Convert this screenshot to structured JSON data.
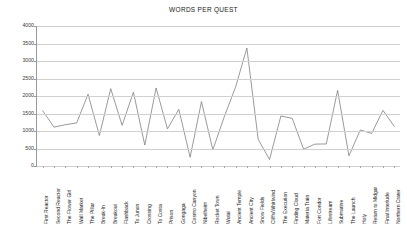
{
  "chart": {
    "title": "WORDS PER QUEST"
  },
  "chart_data": {
    "type": "line",
    "title": "WORDS PER QUEST",
    "xlabel": "",
    "ylabel": "",
    "ylim": [
      0,
      4000
    ],
    "ytick_step": 500,
    "yticks": [
      0,
      500,
      1000,
      1500,
      2000,
      2500,
      3000,
      3500,
      4000
    ],
    "grid": true,
    "legend": "none",
    "line_color": "#808080",
    "categories": [
      "First Reactor",
      "Second Reactor",
      "The Flower Girl",
      "Wall Market",
      "The Pillar",
      "Break-In",
      "Breakout",
      "Flashback",
      "To Junon",
      "Crossing",
      "To Costa",
      "Prison",
      "Gongaga",
      "Cosmo Canyon",
      "Nibelheim",
      "Rocket Town",
      "Wutai",
      "Ancient Temple",
      "Ancient City",
      "Snow Fields",
      "Cliffs/Whirlwind",
      "The Execution",
      "Finding Cloud",
      "Materia Train",
      "Fort Condor",
      "Lifestream",
      "Submarine",
      "The Launch",
      "Holy",
      "Return to Midgar",
      "Final Interlude",
      "Northern Crater"
    ],
    "values": [
      1580,
      1110,
      1180,
      1230,
      2050,
      870,
      2210,
      1160,
      2110,
      600,
      2230,
      1060,
      1620,
      250,
      1840,
      460,
      1400,
      2250,
      3370,
      760,
      185,
      1430,
      1360,
      480,
      625,
      630,
      2160,
      290,
      1030,
      930,
      1590,
      1130
    ],
    "max_value": 3370,
    "max_category": "Ancient Temple",
    "min_value": 185,
    "min_category": "Cliffs/Whirlwind"
  }
}
